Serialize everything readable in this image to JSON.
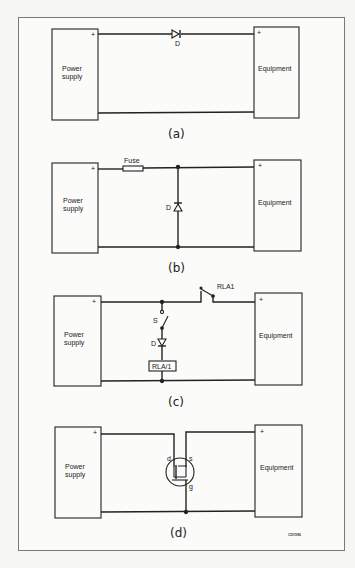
{
  "figure": {
    "code": "CD1596",
    "panels": [
      {
        "id": "a",
        "caption": "(a)",
        "source_label": "Power supply",
        "source_line1": "Power",
        "source_line2": "supply",
        "load_label": "Equipment",
        "plus_source": "+",
        "plus_load": "+",
        "components": [
          {
            "type": "series-diode",
            "label": "D"
          }
        ]
      },
      {
        "id": "b",
        "caption": "(b)",
        "source_line1": "Power",
        "source_line2": "supply",
        "load_label": "Equipment",
        "plus_source": "+",
        "plus_load": "+",
        "components": [
          {
            "type": "fuse",
            "label": "Fuse"
          },
          {
            "type": "shunt-diode",
            "label": "D"
          }
        ]
      },
      {
        "id": "c",
        "caption": "(c)",
        "source_line1": "Power",
        "source_line2": "supply",
        "load_label": "Equipment",
        "plus_source": "+",
        "plus_load": "+",
        "components": [
          {
            "type": "relay-contact",
            "label": "RLA1"
          },
          {
            "type": "switch",
            "label": "S"
          },
          {
            "type": "diode",
            "label": "D"
          },
          {
            "type": "relay-coil",
            "label": "RLA/1"
          }
        ]
      },
      {
        "id": "d",
        "caption": "(d)",
        "source_line1": "Power",
        "source_line2": "supply",
        "load_label": "Equipment",
        "plus_source": "+",
        "plus_load": "+",
        "components": [
          {
            "type": "mosfet",
            "drain": "d",
            "source": "s",
            "gate": "g"
          }
        ]
      }
    ]
  }
}
